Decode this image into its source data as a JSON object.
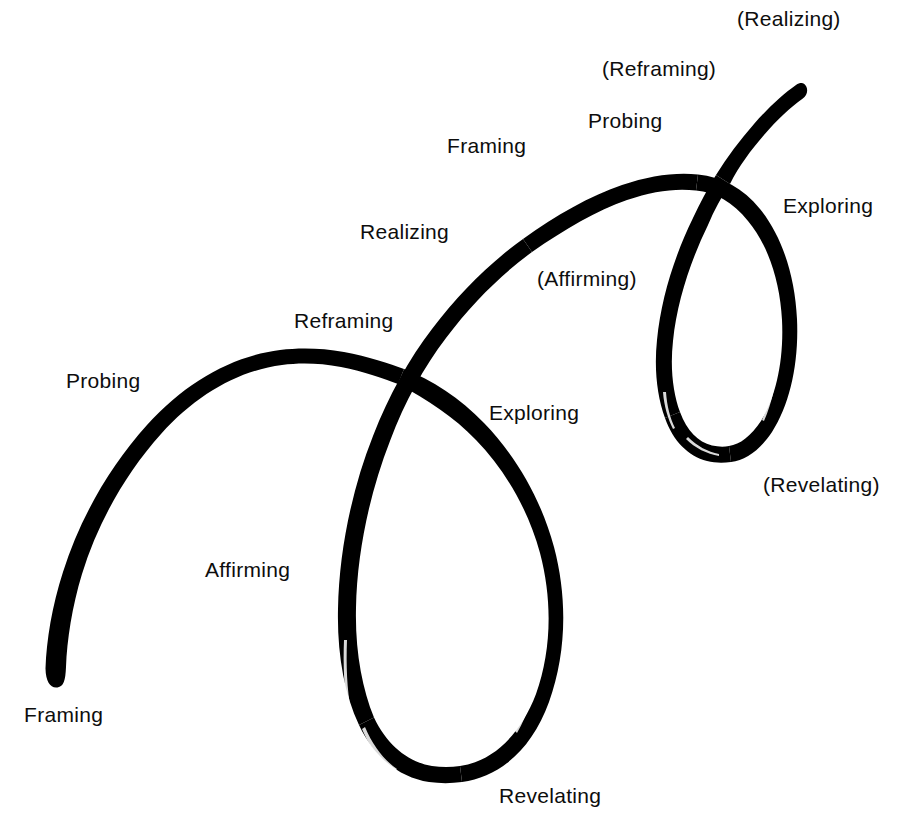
{
  "diagram": {
    "background_color": "#ffffff",
    "stroke_color": "#000000",
    "stroke_style": "hand-drawn brush stroke",
    "cycles": 2,
    "stage_sequence": [
      "Framing",
      "Probing",
      "Reframing",
      "Affirming",
      "Revelating",
      "Exploring",
      "Realizing"
    ],
    "labels": [
      {
        "id": "framing-1",
        "text": "Framing",
        "x": 24,
        "y": 704,
        "cycle": 1,
        "parenthesized": false
      },
      {
        "id": "probing-1",
        "text": "Probing",
        "x": 66,
        "y": 370,
        "cycle": 1,
        "parenthesized": false
      },
      {
        "id": "reframing-1",
        "text": "Reframing",
        "x": 294,
        "y": 310,
        "cycle": 1,
        "parenthesized": false
      },
      {
        "id": "affirming-1",
        "text": "Affirming",
        "x": 205,
        "y": 559,
        "cycle": 1,
        "parenthesized": false
      },
      {
        "id": "revelating-1",
        "text": "Revelating",
        "x": 499,
        "y": 785,
        "cycle": 1,
        "parenthesized": false
      },
      {
        "id": "exploring-1",
        "text": "Exploring",
        "x": 489,
        "y": 402,
        "cycle": 1,
        "parenthesized": false
      },
      {
        "id": "realizing-1",
        "text": "Realizing",
        "x": 360,
        "y": 221,
        "cycle": 2,
        "parenthesized": false
      },
      {
        "id": "framing-2",
        "text": "Framing",
        "x": 447,
        "y": 135,
        "cycle": 2,
        "parenthesized": false
      },
      {
        "id": "probing-2",
        "text": "Probing",
        "x": 588,
        "y": 110,
        "cycle": 2,
        "parenthesized": false
      },
      {
        "id": "reframing-2",
        "text": "(Reframing)",
        "x": 602,
        "y": 58,
        "cycle": 2,
        "parenthesized": true
      },
      {
        "id": "realizing-2",
        "text": "(Realizing)",
        "x": 737,
        "y": 8,
        "cycle": 3,
        "parenthesized": true
      },
      {
        "id": "affirming-2",
        "text": "(Affirming)",
        "x": 537,
        "y": 268,
        "cycle": 2,
        "parenthesized": true
      },
      {
        "id": "exploring-2",
        "text": "Exploring",
        "x": 783,
        "y": 195,
        "cycle": 2,
        "parenthesized": false
      },
      {
        "id": "revelating-2",
        "text": "(Revelating)",
        "x": 763,
        "y": 474,
        "cycle": 2,
        "parenthesized": true
      }
    ],
    "curve": {
      "description": "A single continuous brush-drawn spiral that starts at lower-left, arcs up and right, loops down into a large teardrop loop, rises again across, then loops into a smaller teardrop loop at right, ending with a tail to the upper right.",
      "start_point": {
        "x": 45,
        "y": 668
      },
      "end_point": {
        "x": 800,
        "y": 40
      },
      "crossings": [
        {
          "x": 402,
          "y": 373
        },
        {
          "x": 697,
          "y": 150
        }
      ],
      "loops": [
        {
          "name": "large-loop",
          "center_x": 450,
          "bottom_y": 782,
          "left_x": 338,
          "right_x": 565
        },
        {
          "name": "small-loop",
          "center_x": 730,
          "bottom_y": 462,
          "left_x": 660,
          "right_x": 800
        }
      ]
    }
  }
}
